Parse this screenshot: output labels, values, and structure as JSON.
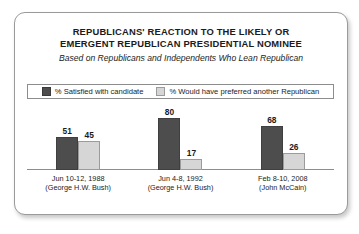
{
  "card": {
    "title_line1": "REPUBLICANS' REACTION TO THE LIKELY OR",
    "title_line2": "EMERGENT REPUBLICAN PRESIDENTIAL NOMINEE",
    "subtitle": "Based on Republicans and Independents Who Lean Republican"
  },
  "legend": {
    "items": [
      {
        "label": "% Satisfied with candidate",
        "color": "#4d4d4d",
        "swatch": "dark"
      },
      {
        "label": "% Would have preferred another Republican",
        "color": "#d6d6d6",
        "swatch": "light"
      }
    ]
  },
  "chart_data": {
    "type": "bar",
    "title": "REPUBLICANS' REACTION TO THE LIKELY OR EMERGENT REPUBLICAN PRESIDENTIAL NOMINEE",
    "subtitle": "Based on Republicans and Independents Who Lean Republican",
    "xlabel": "",
    "ylabel": "",
    "ylim": [
      0,
      100
    ],
    "grid": false,
    "legend_position": "top",
    "categories": [
      "Jun 10-12, 1988",
      "Jun 4-8, 1992",
      "Feb 8-10, 2008"
    ],
    "category_sublabels": [
      "(George H.W. Bush)",
      "(George H.W. Bush)",
      "(John McCain)"
    ],
    "series": [
      {
        "name": "% Satisfied with candidate",
        "color": "#4d4d4d",
        "values": [
          51,
          80,
          68
        ]
      },
      {
        "name": "% Would have preferred another Republican",
        "color": "#d6d6d6",
        "values": [
          45,
          17,
          26
        ]
      }
    ],
    "groups": [
      {
        "label_line1": "Jun 10-12, 1988",
        "label_line2": "(George H.W. Bush)",
        "bars": [
          {
            "value": 51,
            "value_text": "51",
            "series": "satisfied",
            "height_px": 33
          },
          {
            "value": 45,
            "value_text": "45",
            "series": "preferred_another",
            "height_px": 29
          }
        ]
      },
      {
        "label_line1": "Jun 4-8, 1992",
        "label_line2": "(George H.W. Bush)",
        "bars": [
          {
            "value": 80,
            "value_text": "80",
            "series": "satisfied",
            "height_px": 52
          },
          {
            "value": 17,
            "value_text": "17",
            "series": "preferred_another",
            "height_px": 11
          }
        ]
      },
      {
        "label_line1": "Feb 8-10, 2008",
        "label_line2": "(John McCain)",
        "bars": [
          {
            "value": 68,
            "value_text": "68",
            "series": "satisfied",
            "height_px": 44
          },
          {
            "value": 26,
            "value_text": "26",
            "series": "preferred_another",
            "height_px": 17
          }
        ]
      }
    ]
  }
}
